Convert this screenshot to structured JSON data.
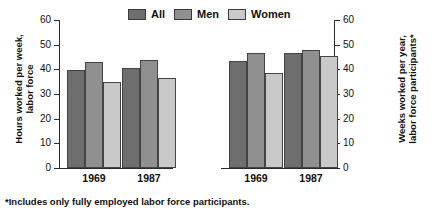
{
  "chart_data": {
    "type": "bar",
    "title": "",
    "panels": [
      {
        "name": "hours-panel",
        "ylabel": "Hours worked per week,\nlabor force",
        "ylabel_line1": "Hours worked per week,",
        "ylabel_line2": "labor force",
        "categories": [
          "1969",
          "1987"
        ],
        "ylim": [
          0,
          60
        ],
        "yticks": [
          0,
          10,
          20,
          30,
          40,
          50,
          60
        ],
        "series": [
          {
            "name": "All",
            "values": [
              39.8,
              40.6
            ]
          },
          {
            "name": "Men",
            "values": [
              43.0,
              43.6
            ]
          },
          {
            "name": "Women",
            "values": [
              35.0,
              36.5
            ]
          }
        ]
      },
      {
        "name": "weeks-panel",
        "ylabel": "Weeks worked per year,\nlabor force participants*",
        "ylabel_line1": "Weeks worked per year,",
        "ylabel_line2": "labor force participants*",
        "categories": [
          "1969",
          "1987"
        ],
        "ylim": [
          0,
          60
        ],
        "yticks": [
          0,
          10,
          20,
          30,
          40,
          50,
          60
        ],
        "series": [
          {
            "name": "All",
            "values": [
              43.3,
              46.8
            ]
          },
          {
            "name": "Men",
            "values": [
              46.5,
              48.0
            ]
          },
          {
            "name": "Women",
            "values": [
              38.7,
              45.6
            ]
          }
        ]
      }
    ],
    "legend": {
      "position": "top-center",
      "entries": [
        {
          "label": "All",
          "color": "#6e6e6e"
        },
        {
          "label": "Men",
          "color": "#909090"
        },
        {
          "label": "Women",
          "color": "#c9c9c9"
        }
      ]
    },
    "grid": false,
    "footnote": "*Includes only fully employed labor force participants."
  },
  "ticks": {
    "t0": "0",
    "t10": "10",
    "t20": "20",
    "t30": "30",
    "t40": "40",
    "t50": "50",
    "t60": "60"
  },
  "legend": {
    "all": "All",
    "men": "Men",
    "women": "Women"
  },
  "left_panel": {
    "title_line1": "Hours worked per week,",
    "title_line2": "labor force",
    "group1": "1969",
    "group2": "1987"
  },
  "right_panel": {
    "title_line1": "Weeks worked per year,",
    "title_line2": "labor force participants*",
    "group1": "1969",
    "group2": "1987"
  },
  "footnote": "*Includes only fully employed labor force participants."
}
